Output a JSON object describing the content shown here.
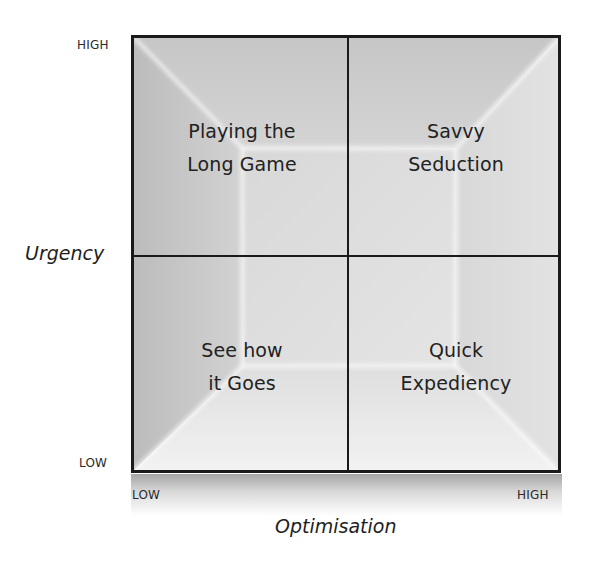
{
  "diagram": {
    "type": "2x2-matrix",
    "y_axis": {
      "title": "Urgency",
      "high_label": "HIGH",
      "low_label": "LOW"
    },
    "x_axis": {
      "title": "Optimisation",
      "low_label": "LOW",
      "high_label": "HIGH"
    },
    "quadrants": {
      "top_left": "Playing the\nLong Game",
      "top_right": "Savvy\nSeduction",
      "bottom_left": "See how\nit Goes",
      "bottom_right": "Quick\nExpediency"
    },
    "colors": {
      "border": "#1a1a1a",
      "fill_dark": "#bdbdbd",
      "fill_light": "#f4f4f4",
      "text": "#222222"
    }
  }
}
